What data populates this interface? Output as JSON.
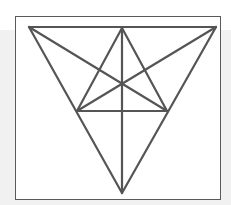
{
  "diagram": {
    "type": "geometric-figure",
    "stroke_color": "#555555",
    "frame_color": "#5a5a5a",
    "background_color": "#f1f1f1",
    "points": {
      "top_left": [
        29,
        27
      ],
      "top_right": [
        216,
        27
      ],
      "top_mid": [
        122,
        28
      ],
      "bottom": [
        122,
        193
      ],
      "left_mid": [
        77,
        111
      ],
      "right_mid": [
        167,
        111
      ],
      "center": [
        122,
        83
      ]
    },
    "lines": [
      {
        "name": "top-edge",
        "from": "top_left",
        "to": "top_right"
      },
      {
        "name": "left-edge",
        "from": "top_left",
        "to": "bottom"
      },
      {
        "name": "right-edge",
        "from": "top_right",
        "to": "bottom"
      },
      {
        "name": "vertical-median",
        "from": "top_mid",
        "to": "bottom"
      },
      {
        "name": "left-median",
        "from": "top_left",
        "to": "right_mid"
      },
      {
        "name": "right-median",
        "from": "top_right",
        "to": "left_mid"
      },
      {
        "name": "inner-left",
        "from": "top_mid",
        "to": "left_mid"
      },
      {
        "name": "inner-right",
        "from": "top_mid",
        "to": "right_mid"
      },
      {
        "name": "inner-base",
        "from": "left_mid",
        "to": "right_mid"
      }
    ]
  }
}
